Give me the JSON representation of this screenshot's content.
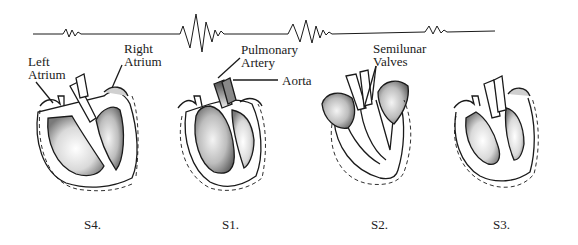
{
  "waveform": {
    "description": "heart sound waveform with four bursts",
    "bursts": [
      "S4",
      "S1",
      "S2",
      "S3"
    ]
  },
  "labels": {
    "left_atrium": [
      "Left",
      "Atrium"
    ],
    "right_atrium": [
      "Right",
      "Atrium"
    ],
    "pulmonary_artery": [
      "Pulmonary",
      "Artery"
    ],
    "aorta": "Aorta",
    "semilunar_valves": [
      "Semilunar",
      "Valves"
    ]
  },
  "captions": [
    {
      "id": "s4",
      "text": "S4."
    },
    {
      "id": "s1",
      "text": "S1."
    },
    {
      "id": "s2",
      "text": "S2."
    },
    {
      "id": "s3",
      "text": "S3."
    }
  ],
  "colors": {
    "ink": "#1a1a1a",
    "background": "#ffffff",
    "shading": "#6b6b6b"
  }
}
